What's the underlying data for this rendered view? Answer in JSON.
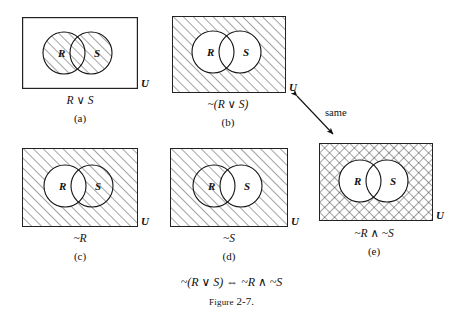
{
  "figure": {
    "caption_label": "Figure",
    "caption_number": "2-7.",
    "identity": "~(R ∨ S)  ⇔  ~R ∧ ~S",
    "connector_label": "same",
    "universe_label": "U",
    "set_r_label": "R",
    "set_s_label": "S"
  },
  "panels": [
    {
      "id": "a",
      "letter": "(a)",
      "expression": "R ∨ S",
      "universe": "U",
      "r_label": "R",
      "s_label": "S",
      "shading": "both-circles-hatched",
      "hatch": "diagonal"
    },
    {
      "id": "b",
      "letter": "(b)",
      "expression": "~(R ∨ S)",
      "universe": "U",
      "r_label": "R",
      "s_label": "S",
      "shading": "outside-both-circles-hatched",
      "hatch": "diagonal"
    },
    {
      "id": "c",
      "letter": "(c)",
      "expression": "~R",
      "universe": "U",
      "r_label": "R",
      "s_label": "S",
      "shading": "outside-r-hatched",
      "hatch": "diagonal"
    },
    {
      "id": "d",
      "letter": "(d)",
      "expression": "~S",
      "universe": "U",
      "r_label": "R",
      "s_label": "S",
      "shading": "outside-s-hatched",
      "hatch": "diagonal"
    },
    {
      "id": "e",
      "letter": "(e)",
      "expression": "~R ∧ ~S",
      "universe": "U",
      "r_label": "R",
      "s_label": "S",
      "shading": "outside-both-circles-crosshatched",
      "hatch": "crosshatch"
    }
  ],
  "colors": {
    "ink": "#111111",
    "paper": "#ffffff",
    "hatch_line": "#333333",
    "border": "#222222"
  }
}
